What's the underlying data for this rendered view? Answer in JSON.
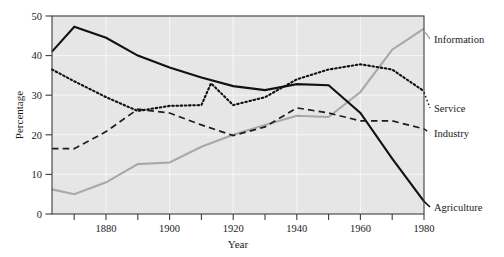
{
  "chart_data": {
    "type": "line",
    "title": "",
    "xlabel": "Year",
    "ylabel": "Percentage",
    "xlim": [
      1863,
      1980
    ],
    "ylim": [
      0,
      50
    ],
    "grid": true,
    "legend_position": "right-edge-inline",
    "y_ticks": [
      "0",
      "10",
      "20",
      "30",
      "40",
      "50"
    ],
    "y_tick_values": [
      0,
      10,
      20,
      30,
      40,
      50
    ],
    "x_ticks": [
      "1880",
      "1900",
      "1920",
      "1940",
      "1960",
      "1980"
    ],
    "x_tick_values": [
      1880,
      1900,
      1920,
      1940,
      1960,
      1980
    ],
    "x_minor_ticks": [
      1870,
      1890,
      1910,
      1930,
      1950,
      1970
    ],
    "series": [
      {
        "name": "Agriculture",
        "style": "solid-black",
        "color": "#111111",
        "x": [
          1863,
          1870,
          1880,
          1890,
          1900,
          1910,
          1920,
          1930,
          1940,
          1950,
          1960,
          1970,
          1980
        ],
        "values": [
          41,
          47.3,
          44.5,
          40,
          37,
          34.5,
          32.3,
          31.3,
          32.8,
          32.5,
          25.5,
          14,
          3.2
        ]
      },
      {
        "name": "Service",
        "style": "dotted-black",
        "color": "#111111",
        "x": [
          1863,
          1870,
          1880,
          1890,
          1900,
          1910,
          1913,
          1920,
          1930,
          1940,
          1950,
          1960,
          1970,
          1980
        ],
        "values": [
          36.5,
          33.5,
          29.5,
          26,
          27.3,
          27.5,
          33,
          27.5,
          29.5,
          34,
          36.5,
          37.8,
          36.5,
          31
        ],
        "note": "dotted curve peaking near 1913"
      },
      {
        "name": "Industry",
        "style": "dashed-black",
        "color": "#1d1d1d",
        "x": [
          1863,
          1870,
          1880,
          1890,
          1900,
          1910,
          1920,
          1930,
          1940,
          1950,
          1960,
          1970,
          1980
        ],
        "values": [
          16.5,
          16.5,
          20.8,
          26.5,
          25.5,
          22.5,
          19.8,
          22,
          26.8,
          25.5,
          23.5,
          23.5,
          21.5
        ]
      },
      {
        "name": "Information",
        "style": "solid-gray",
        "color": "#a8a8a8",
        "x": [
          1863,
          1870,
          1880,
          1890,
          1900,
          1910,
          1920,
          1930,
          1940,
          1950,
          1960,
          1970,
          1980
        ],
        "values": [
          6.2,
          5.0,
          8.0,
          12.6,
          13.0,
          17.0,
          20.0,
          22.5,
          24.8,
          24.5,
          30.8,
          41.5,
          46.8
        ]
      }
    ]
  },
  "labels": {
    "information": "Information",
    "service": "Service",
    "industry": "Industry",
    "agriculture": "Agriculture"
  },
  "colors": {
    "plot_background": "#e6e6e6",
    "gridline": "#f7f7f7",
    "frame": "#3c3c3c",
    "ink": "#111111",
    "gray_series": "#a8a8a8"
  }
}
